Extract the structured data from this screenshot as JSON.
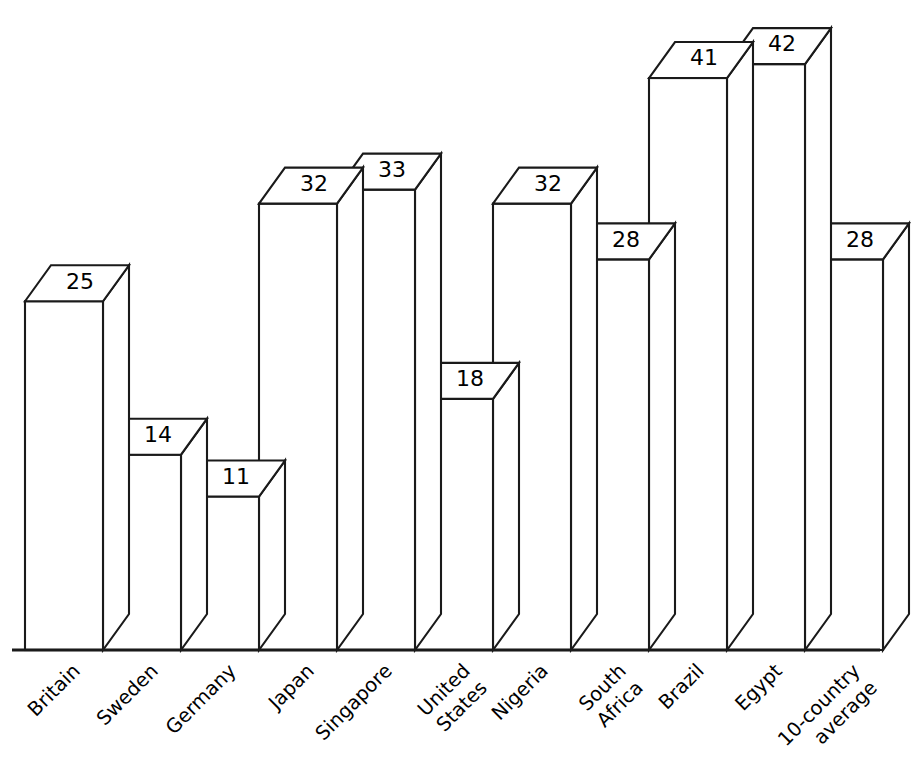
{
  "chart_data": {
    "type": "bar",
    "title": "",
    "subtitle": "",
    "xlabel": "",
    "ylabel": "",
    "ylim": [
      0,
      46
    ],
    "grid": false,
    "legend": false,
    "style": "3d-isometric-bar",
    "value_labels_shown": true,
    "categories": [
      "Britain",
      "Sweden",
      "Germany",
      "Japan",
      "Singapore",
      "United States",
      "Nigeria",
      "South Africa",
      "Brazil",
      "Egypt",
      "10-country average"
    ],
    "category_lines": [
      [
        "Britain"
      ],
      [
        "Sweden"
      ],
      [
        "Germany"
      ],
      [
        "Japan"
      ],
      [
        "Singapore"
      ],
      [
        "United",
        "States"
      ],
      [
        "Nigeria"
      ],
      [
        "South",
        "Africa"
      ],
      [
        "Brazil"
      ],
      [
        "Egypt"
      ],
      [
        "10-country",
        "average"
      ]
    ],
    "values": [
      25,
      14,
      11,
      32,
      33,
      18,
      32,
      28,
      41,
      42,
      28
    ],
    "value_text": [
      "25",
      "14",
      "11",
      "32",
      "33",
      "18",
      "32",
      "28",
      "41",
      "42",
      "28"
    ],
    "colors": {
      "bar_fill": "#ffffff",
      "bar_stroke": "#1a1a1a",
      "background": "#ffffff",
      "text": "#000000"
    }
  },
  "geometry": {
    "baseline_y": 650,
    "plot_left": 25,
    "bar_width": 78,
    "depth_x": 26,
    "depth_y": 36,
    "px_per_unit": 13.95,
    "label_rotation_deg": -45
  }
}
